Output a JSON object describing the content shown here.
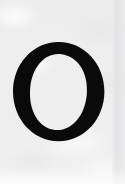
{
  "image": {
    "kind": "letterform-specimen",
    "width_px": 125,
    "height_px": 184,
    "description": "Single black serif capital letter O on a light gray paper background"
  },
  "canvas": {
    "background_color": "#eeeeef",
    "background_color_light": "#f1f1f2",
    "background_color_dark": "#e8e8e9",
    "texture": "paper-grain"
  },
  "glyph": {
    "character": "O",
    "name": "capital-letter-o",
    "style": "serif",
    "stress": "diagonal",
    "color": "#0a0a0a",
    "bounds": {
      "left_px": 13,
      "top_px": 42,
      "right_px": 104,
      "bottom_px": 141,
      "width_px": 91,
      "height_px": 99
    },
    "stroke": {
      "thick_px": 18,
      "thin_px": 7
    },
    "counter": {
      "width_px": 56,
      "height_px": 85
    }
  },
  "edges": {
    "right_band_label": "right-edge-shadow",
    "right_band_color": "#e2e2e4",
    "bottom_band_label": "bottom-edge-highlight",
    "bottom_band_color": "#f5f5f6"
  }
}
